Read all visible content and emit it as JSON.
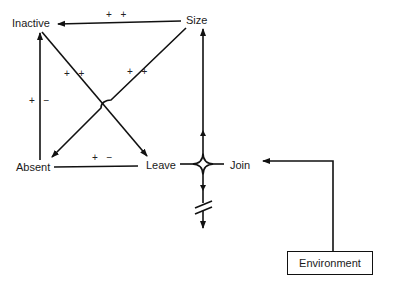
{
  "diagram": {
    "nodes": {
      "inactive": "Inactive",
      "size": "Size",
      "absent": "Absent",
      "leave": "Leave",
      "join": "Join",
      "environment": "Environment"
    },
    "edge_labels": {
      "size_to_inactive": "+ +",
      "inactive_to_leave": "+ +",
      "size_to_absent": "+ +",
      "absent_to_inactive": "+ −",
      "leave_to_absent": "+ −"
    },
    "edges": [
      {
        "from": "Size",
        "to": "Inactive",
        "sign": "+ +"
      },
      {
        "from": "Inactive",
        "to": "Leave",
        "sign": "+ +"
      },
      {
        "from": "Size",
        "to": "Absent",
        "sign": "+ +"
      },
      {
        "from": "Absent",
        "to": "Inactive",
        "sign": "+ −"
      },
      {
        "from": "Leave",
        "to": "Absent",
        "sign": "+ −"
      },
      {
        "from": "Leave/Join junction",
        "to": "Size",
        "sign": ""
      },
      {
        "from": "Environment",
        "to": "Join",
        "sign": ""
      }
    ],
    "colors": {
      "line": "#111111",
      "background": "#ffffff"
    }
  }
}
